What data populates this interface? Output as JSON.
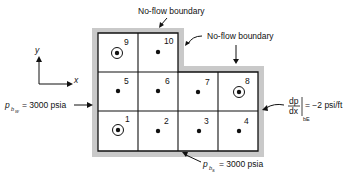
{
  "diagram": {
    "labels": {
      "top_boundary": "No-flow boundary",
      "right_boundary": "No-flow boundary",
      "west_pressure_prefix": "p",
      "west_pressure_sub": "b",
      "west_pressure_subsub": "W",
      "west_pressure_value": "= 3000 psia",
      "south_pressure_prefix": "p",
      "south_pressure_sub": "b",
      "south_pressure_subsub": "S",
      "south_pressure_value": "= 3000 psia",
      "east_grad_num": "dp",
      "east_grad_den": "dx",
      "east_grad_sub": "bE",
      "east_grad_value": "= −2 psi/ft",
      "axis_x": "x",
      "axis_y": "y"
    },
    "blocks": [
      {
        "id": "1",
        "well": true
      },
      {
        "id": "2",
        "well": false
      },
      {
        "id": "3",
        "well": false
      },
      {
        "id": "4",
        "well": false
      },
      {
        "id": "5",
        "well": false
      },
      {
        "id": "6",
        "well": false
      },
      {
        "id": "7",
        "well": false
      },
      {
        "id": "8",
        "well": true
      },
      {
        "id": "9",
        "well": true
      },
      {
        "id": "10",
        "well": false
      }
    ],
    "colors": {
      "boundary_gray": "#c8c8c8",
      "line": "#111111"
    }
  }
}
